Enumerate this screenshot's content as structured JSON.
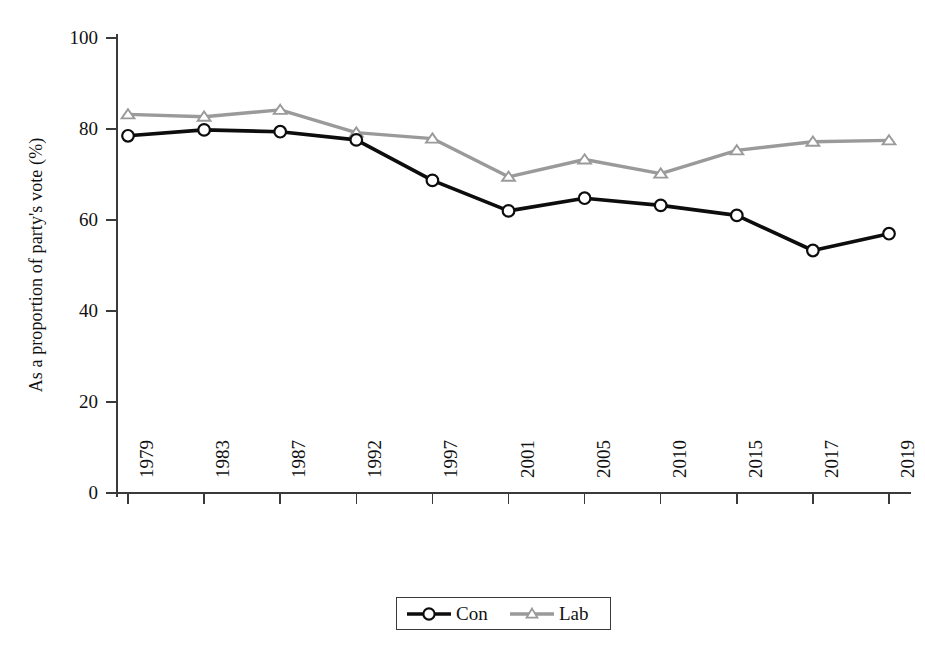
{
  "chart_data": {
    "type": "line",
    "title": "",
    "xlabel": "",
    "ylabel": "As a proportion of party's vote (%)",
    "categories": [
      "1979",
      "1983",
      "1987",
      "1992",
      "1997",
      "2001",
      "2005",
      "2010",
      "2015",
      "2017",
      "2019"
    ],
    "ylim": [
      0,
      100
    ],
    "yticks": [
      "0",
      "20",
      "40",
      "60",
      "80",
      "100"
    ],
    "grid": false,
    "legend_position": "bottom-center",
    "series": [
      {
        "name": "Con",
        "color": "#0d0d0d",
        "marker": "circle",
        "values": [
          78.5,
          79.8,
          79.4,
          77.6,
          68.7,
          62.0,
          64.8,
          63.2,
          61.0,
          53.3,
          57.0
        ]
      },
      {
        "name": "Lab",
        "color": "#9a9a9a",
        "marker": "triangle",
        "values": [
          83.2,
          82.7,
          84.2,
          79.2,
          77.9,
          69.5,
          73.3,
          70.2,
          75.3,
          77.2,
          77.5
        ]
      }
    ]
  },
  "legend": {
    "entries": [
      {
        "label": "Con"
      },
      {
        "label": "Lab"
      }
    ]
  },
  "axes": {
    "y_title": "As a proportion of party's vote (%)"
  }
}
